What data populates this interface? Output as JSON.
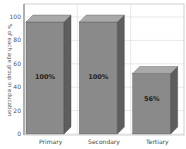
{
  "chart_data": {
    "type": "bar",
    "title": "",
    "xlabel": "",
    "ylabel": "% of each age group in education",
    "categories": [
      "Primary",
      "Secondary",
      "Tertiary"
    ],
    "values": [
      100,
      100,
      56
    ],
    "data_labels": [
      "100%",
      "100%",
      "56%"
    ],
    "ylim": [
      0,
      100
    ],
    "yticks": [
      0,
      20,
      40,
      60,
      80,
      100
    ],
    "grid": true,
    "legend": null,
    "style": "3d"
  },
  "colors": {
    "bar_front": "#8a8a8a",
    "bar_side": "#5e5e5e",
    "bar_top": "#a9a9a9",
    "grid": "#d8d8d8",
    "axis": "#777777"
  }
}
